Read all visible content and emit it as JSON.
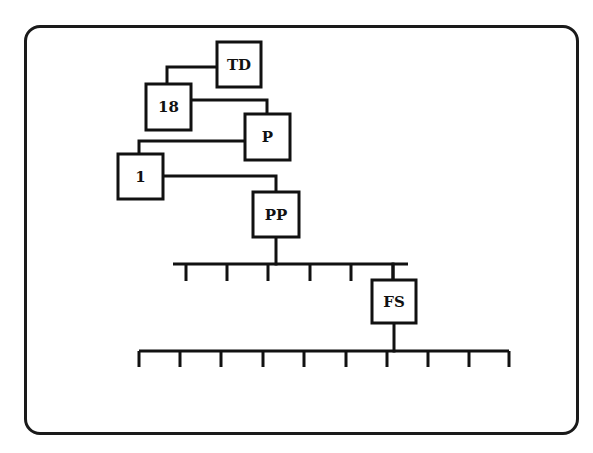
{
  "diagram": {
    "type": "hierarchy",
    "stroke_color": "#111111",
    "nodes": [
      {
        "id": "TD",
        "label": "TD",
        "x": 217,
        "y": 42,
        "w": 44,
        "h": 45
      },
      {
        "id": "18",
        "label": "18",
        "x": 146,
        "y": 84,
        "w": 45,
        "h": 46
      },
      {
        "id": "P",
        "label": "P",
        "x": 245,
        "y": 114,
        "w": 45,
        "h": 46
      },
      {
        "id": "1",
        "label": "1",
        "x": 118,
        "y": 154,
        "w": 45,
        "h": 45
      },
      {
        "id": "PP",
        "label": "PP",
        "x": 253,
        "y": 192,
        "w": 46,
        "h": 45
      },
      {
        "id": "FS",
        "label": "FS",
        "x": 372,
        "y": 280,
        "w": 44,
        "h": 43
      }
    ],
    "edges": [
      {
        "from": "18",
        "to": "TD"
      },
      {
        "from": "18",
        "to": "P"
      },
      {
        "from": "1",
        "to": "P"
      },
      {
        "from": "1",
        "to": "PP"
      },
      {
        "from": "PP",
        "to": "bus-1"
      },
      {
        "from": "bus-1",
        "to": "FS"
      },
      {
        "from": "FS",
        "to": "bus-2"
      }
    ],
    "buses": [
      {
        "id": "bus-1",
        "y": 264,
        "x1": 173,
        "x2": 408,
        "tick_len": 17,
        "ticks": [
          186,
          227,
          268,
          310,
          351,
          393
        ],
        "tick_count": 6
      },
      {
        "id": "bus-2",
        "y": 351,
        "x1": 139,
        "x2": 509,
        "tick_len": 16,
        "ticks": [
          139,
          180,
          221,
          263,
          304,
          346,
          387,
          428,
          469,
          509
        ],
        "tick_count": 10
      }
    ]
  }
}
